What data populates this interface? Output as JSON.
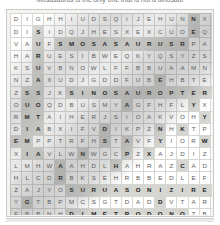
{
  "caption": {
    "text": "Mosasaurus is the only one that is not a dinosaur"
  },
  "puzzle": {
    "type": "word-search",
    "rows": 18,
    "cols": 20,
    "grid": [
      "DIGHHIUDSQIJEHUNNXPW",
      "DISIDQJHESXEXCUOEQWD",
      "VAUFSMOSASAURUSRPACI",
      "HARUESIBWEQKYQSYZSJQ",
      "KSUVBNOWLFFBBUAAMNJB",
      "NZAXUDJGDDFUBEHBTEAL",
      "ZSSJKSINOSAUROPTERYX",
      "OUOQDBUSMYAGFHFLYXWJ",
      "RMTAIHERJSIOAKVOHYSM",
      "DIABXIFVDIKPZNHKTPND",
      "EMPPTRFHSTAVFYIORWJY",
      "XIAVLWNWGCPZXAJDIZRY",
      "LMHWAAHDLHAHRAZCADS",
      "HLCDRBKSEHRBBEDLEFVF",
      "ZAJYOSURUASONIZIREHT",
      "YGTBPMCSGTDADDVTARZB",
      "FBBNHDIMETRODONOTBLF",
      "DIPLODOCUSYSZWGFDYID",
      "TRWUCSURUATONRACPMHX",
      "SYKMEMJCWUZCAUBZSGXO"
    ],
    "highlighted_cells": [
      [
        0,
        16
      ],
      [
        1,
        2
      ],
      [
        1,
        16
      ],
      [
        2,
        2
      ],
      [
        2,
        4
      ],
      [
        2,
        5
      ],
      [
        2,
        6
      ],
      [
        2,
        7
      ],
      [
        2,
        8
      ],
      [
        2,
        9
      ],
      [
        2,
        10
      ],
      [
        2,
        11
      ],
      [
        2,
        12
      ],
      [
        2,
        13
      ],
      [
        2,
        14
      ],
      [
        2,
        15
      ],
      [
        3,
        2
      ],
      [
        4,
        2
      ],
      [
        4,
        19
      ],
      [
        5,
        2
      ],
      [
        5,
        13
      ],
      [
        6,
        1
      ],
      [
        6,
        2
      ],
      [
        6,
        5
      ],
      [
        6,
        6
      ],
      [
        6,
        7
      ],
      [
        6,
        8
      ],
      [
        6,
        9
      ],
      [
        6,
        10
      ],
      [
        6,
        11
      ],
      [
        6,
        12
      ],
      [
        6,
        13
      ],
      [
        6,
        14
      ],
      [
        6,
        15
      ],
      [
        6,
        16
      ],
      [
        6,
        17
      ],
      [
        6,
        18
      ],
      [
        6,
        19
      ],
      [
        7,
        1
      ],
      [
        7,
        2
      ],
      [
        7,
        10
      ],
      [
        7,
        16
      ],
      [
        8,
        1
      ],
      [
        8,
        2
      ],
      [
        8,
        17
      ],
      [
        9,
        1
      ],
      [
        9,
        2
      ],
      [
        9,
        8
      ],
      [
        9,
        13
      ],
      [
        9,
        15
      ],
      [
        10,
        0
      ],
      [
        10,
        1
      ],
      [
        10,
        8
      ],
      [
        10,
        10
      ],
      [
        10,
        13
      ],
      [
        10,
        17
      ],
      [
        11,
        1
      ],
      [
        11,
        2
      ],
      [
        11,
        6
      ],
      [
        11,
        10
      ],
      [
        11,
        12
      ],
      [
        12,
        4
      ],
      [
        12,
        9
      ],
      [
        12,
        15
      ],
      [
        13,
        4
      ],
      [
        14,
        5
      ],
      [
        14,
        6
      ],
      [
        14,
        7
      ],
      [
        14,
        8
      ],
      [
        14,
        9
      ],
      [
        14,
        10
      ],
      [
        14,
        11
      ],
      [
        14,
        12
      ],
      [
        14,
        13
      ],
      [
        14,
        14
      ],
      [
        14,
        15
      ],
      [
        14,
        16
      ],
      [
        14,
        17
      ],
      [
        14,
        18
      ],
      [
        14,
        19
      ],
      [
        15,
        1
      ],
      [
        15,
        13
      ],
      [
        16,
        5
      ],
      [
        16,
        6
      ],
      [
        16,
        7
      ],
      [
        16,
        8
      ],
      [
        16,
        9
      ],
      [
        16,
        10
      ],
      [
        16,
        11
      ],
      [
        16,
        12
      ],
      [
        16,
        13
      ],
      [
        16,
        14
      ],
      [
        16,
        15
      ],
      [
        17,
        0
      ],
      [
        17,
        1
      ],
      [
        17,
        2
      ],
      [
        17,
        3
      ],
      [
        17,
        4
      ],
      [
        17,
        5
      ],
      [
        17,
        6
      ],
      [
        17,
        7
      ],
      [
        17,
        8
      ],
      [
        17,
        15
      ],
      [
        18,
        5
      ],
      [
        18,
        6
      ],
      [
        18,
        7
      ],
      [
        18,
        8
      ],
      [
        18,
        9
      ],
      [
        18,
        10
      ],
      [
        18,
        11
      ],
      [
        18,
        12
      ],
      [
        18,
        13
      ],
      [
        18,
        14
      ],
      [
        18,
        15
      ],
      [
        19,
        16
      ]
    ],
    "found_words": [
      "MOSASAURUS",
      "SINOSAUROPTERYX",
      "THERIZINOSAURUS",
      "DIMETRODON",
      "DIPLODOCUS",
      "CARNOTAURUS"
    ],
    "colors": {
      "page_background": "#ffffff",
      "panel_background": "#f3f3f1",
      "panel_border": "#c9c9c6",
      "cell_background": "#ffffff",
      "cell_border": "#d6d6d3",
      "letter": "#5d5d5d",
      "highlight_background": "#d5d5d2",
      "highlight_letter": "#1c1c1c"
    }
  }
}
